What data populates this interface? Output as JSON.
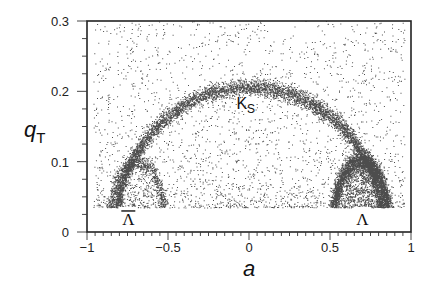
{
  "chart_data": {
    "type": "scatter",
    "title": "",
    "xlabel": "a",
    "ylabel": "q_T",
    "ylabel_main": "q",
    "ylabel_sub": "T",
    "xlim": [
      -1,
      1
    ],
    "ylim": [
      0,
      0.3
    ],
    "xticks": [
      -1,
      -0.5,
      0,
      0.5,
      1
    ],
    "xtick_labels": [
      "−1",
      "−0.5",
      "0",
      "0.5",
      "1"
    ],
    "yticks": [
      0,
      0.1,
      0.2,
      0.3
    ],
    "ytick_labels": [
      "0",
      "0.1",
      "0.2",
      "0.3"
    ],
    "x_minor_step": 0.05,
    "y_minor_step": 0.025,
    "grid": false,
    "legend": null,
    "qT_cut": 0.035,
    "annotations": [
      {
        "text": "K",
        "sub": "S",
        "x": -0.02,
        "y": 0.175,
        "name": "ks-label"
      },
      {
        "text": "Λ",
        "overline": true,
        "x": -0.745,
        "y": 0.01,
        "name": "antilambda-label"
      },
      {
        "text": "Λ",
        "overline": false,
        "x": 0.7,
        "y": 0.01,
        "name": "lambda-label"
      }
    ],
    "series": [
      {
        "name": "K_S ellipse",
        "shape": "ellipse",
        "center_a": 0.0,
        "half_width_a": 0.83,
        "peak_qT": 0.206,
        "spread_qT": 0.006,
        "points": 6000
      },
      {
        "name": "Lambda ellipse",
        "shape": "ellipse",
        "center_a": 0.69,
        "half_width_a": 0.18,
        "peak_qT": 0.101,
        "spread_qT": 0.007,
        "points": 3500
      },
      {
        "name": "Anti-Lambda ellipse",
        "shape": "ellipse",
        "center_a": -0.69,
        "half_width_a": 0.18,
        "peak_qT": 0.101,
        "spread_qT": 0.006,
        "points": 900
      },
      {
        "name": "Background",
        "shape": "uniform-decaying",
        "qT_range": [
          0.035,
          0.3
        ],
        "points": 2500
      }
    ]
  }
}
